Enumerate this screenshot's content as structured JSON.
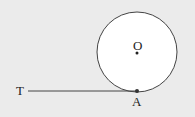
{
  "diagram": {
    "background": "#ebebeb",
    "stroke_color": "#444444",
    "circle": {
      "center_label": "O",
      "cx": 137,
      "cy": 52,
      "r": 40
    },
    "tangent_line": {
      "start_label": "T",
      "end_label": "A",
      "x1": 28,
      "y1": 91,
      "x2": 137,
      "y2": 91
    },
    "points": [
      {
        "label": "O",
        "x": 137,
        "y": 52
      },
      {
        "label": "A",
        "x": 137,
        "y": 91
      }
    ]
  }
}
